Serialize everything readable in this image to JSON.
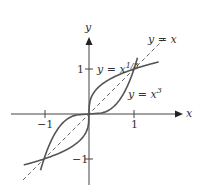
{
  "figure": {
    "axes": {
      "x_label": "x",
      "y_label": "y",
      "x_ticks": [
        {
          "value": -1,
          "label": "−1"
        },
        {
          "value": 1,
          "label": "1"
        }
      ],
      "y_ticks": [
        {
          "value": 1,
          "label": "1"
        },
        {
          "value": -1,
          "label": "−1"
        }
      ]
    },
    "curves": [
      {
        "name": "cube-root",
        "label_prefix": "y = x",
        "label_sup": "1/3",
        "style": "solid"
      },
      {
        "name": "cube",
        "label_prefix": "y = x",
        "label_sup": "3",
        "style": "solid"
      },
      {
        "name": "identity",
        "label": "y = x",
        "style": "dashed"
      }
    ],
    "colors": {
      "curve": "#555555",
      "axis": "#444444",
      "text": "#333333",
      "background": "#ffffff"
    }
  }
}
